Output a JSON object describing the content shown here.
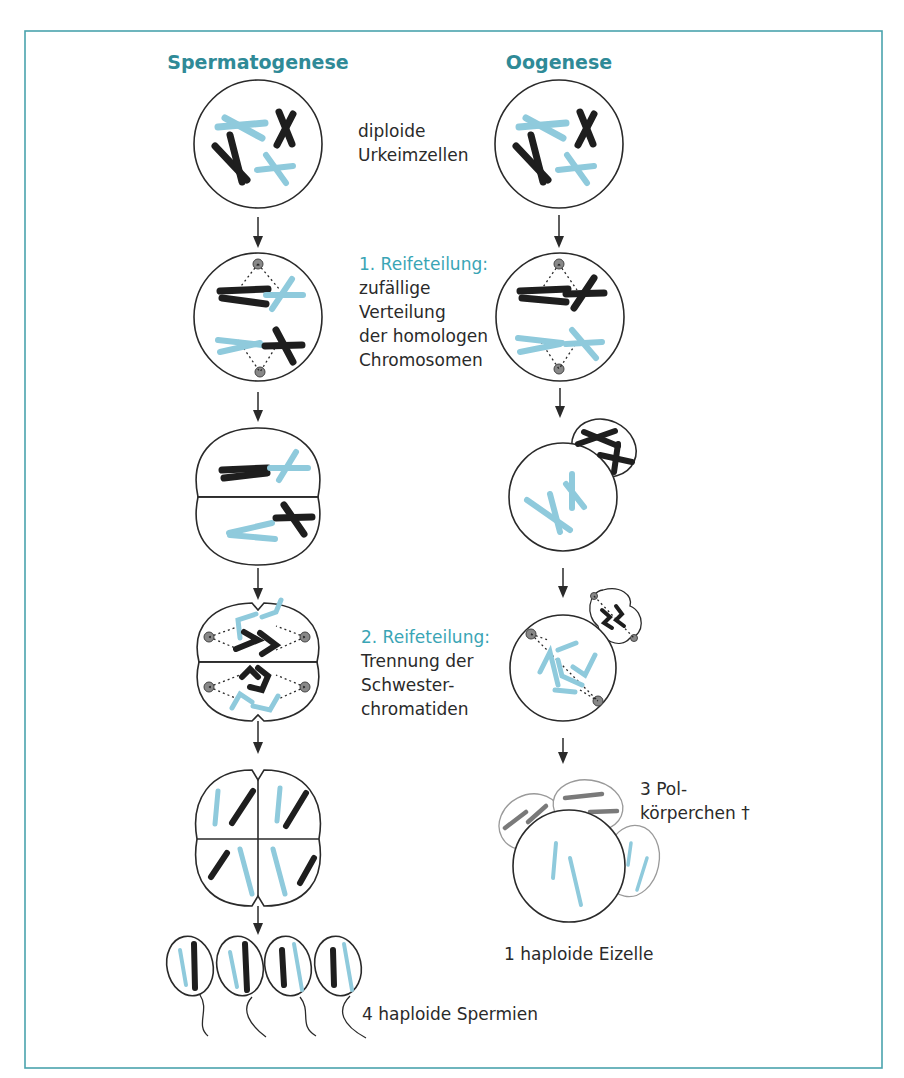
{
  "frame": {
    "border_color": "#4aa3ad"
  },
  "columns": {
    "left_title": "Spermatogenese",
    "right_title": "Oogenese"
  },
  "colors": {
    "title": "#2f8a97",
    "accent_text": "#3aa5b5",
    "chromosome_dark": "#1e1e1e",
    "chromosome_light": "#8fcadc",
    "polar_body_chromosome": "#7a7a7a"
  },
  "annotations": {
    "stage1": {
      "line1": "diploide",
      "line2": "Urkeimzellen"
    },
    "stage2": {
      "heading": "1. Reifeteilung:",
      "line1": "zufällige",
      "line2": "Verteilung",
      "line3": "der homologen",
      "line4": "Chromosomen"
    },
    "stage4": {
      "heading": "2. Reifeteilung:",
      "line1": "Trennung der",
      "line2": "Schwester-",
      "line3": "chromatiden"
    },
    "polar_bodies": {
      "line1": "3 Pol-",
      "line2": "körperchen †"
    },
    "egg": "1 haploide Eizelle",
    "sperm": "4 haploide Spermien"
  },
  "stages": [
    {
      "id": "primordial",
      "spermatogenesis": "1 diploid cell",
      "oogenesis": "1 diploid cell"
    },
    {
      "id": "meiosis1-metaphase",
      "spermatogenesis": "1 cell, spindle",
      "oogenesis": "1 cell, spindle"
    },
    {
      "id": "meiosis1-division",
      "spermatogenesis": "2 equal cells",
      "oogenesis": "1 large cell + 1 polar body"
    },
    {
      "id": "meiosis2-metaphase",
      "spermatogenesis": "2 cells, spindles",
      "oogenesis": "1 large cell + polar body dividing"
    },
    {
      "id": "meiosis2-division",
      "spermatogenesis": "4 equal cells",
      "oogenesis": "1 egg + 3 polar bodies"
    },
    {
      "id": "gametes",
      "spermatogenesis": "4 sperm",
      "oogenesis": ""
    }
  ]
}
